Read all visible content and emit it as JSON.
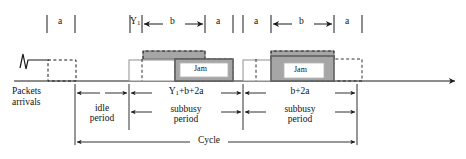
{
  "figure": {
    "type": "timing-diagram"
  },
  "top_axis": {
    "segments": [
      {
        "id": "seg-a-1",
        "label": "a",
        "x_start": 47,
        "x_end": 75,
        "arrows": false
      },
      {
        "id": "seg-y1",
        "label": "Y1",
        "x_start": 130,
        "x_end": 142,
        "arrows": false
      },
      {
        "id": "seg-b-1",
        "label": "b",
        "x_start": 142,
        "x_end": 205,
        "arrows": true
      },
      {
        "id": "seg-a-2",
        "label": "a",
        "x_start": 205,
        "x_end": 233,
        "arrows": false
      },
      {
        "id": "seg-a-3",
        "label": "a",
        "x_start": 243,
        "x_end": 271,
        "arrows": false
      },
      {
        "id": "seg-b-2",
        "label": "b",
        "x_start": 271,
        "x_end": 334,
        "arrows": true
      },
      {
        "id": "seg-a-4",
        "label": "a",
        "x_start": 334,
        "x_end": 362,
        "arrows": false
      }
    ],
    "label_y1_base": "Y",
    "label_y1_sub": "1"
  },
  "waveform": {
    "baseline_label": "time-axis",
    "packets_arrivals": {
      "line1": "Packets",
      "line2": "arrivals",
      "icon": "sawtooth-arrival-icon"
    },
    "jam_boxes": [
      {
        "id": "jam-box-1",
        "label": "Jam",
        "fill": "#ffffff",
        "border": "#808080"
      },
      {
        "id": "jam-box-2",
        "label": "Jam",
        "fill": "#ffffff",
        "border": "#808080"
      }
    ]
  },
  "measures": {
    "idle": {
      "line1": "idle",
      "line2": "period",
      "x_start": 75,
      "x_end": 129
    },
    "subbusy_1": {
      "duration_base": "Y",
      "duration_sub": "1",
      "duration_rest": "+b+2a",
      "line1": "subbusy",
      "line2": "period",
      "x_start": 129,
      "x_end": 243
    },
    "subbusy_2": {
      "duration": "b+2a",
      "line1": "subbusy",
      "line2": "period",
      "x_start": 243,
      "x_end": 357
    },
    "cycle": {
      "label": "Cycle",
      "x_start": 75,
      "x_end": 357
    }
  },
  "colors": {
    "gray_fill": "#a6a6a6",
    "gray_dark_border": "#6e6e6e",
    "stroke": "#1a1a1a",
    "white": "#ffffff"
  }
}
